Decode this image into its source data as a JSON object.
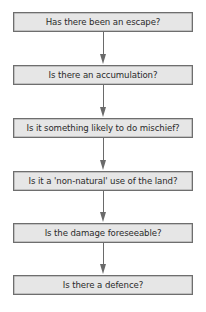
{
  "diagram": {
    "type": "flowchart",
    "direction": "top-to-bottom",
    "colors": {
      "box_fill": "#e6e6e6",
      "box_border": "#6e6e6e",
      "arrow": "#6a6a6a",
      "text": "#2a2a2a"
    },
    "steps": [
      {
        "label": "Has there been an escape?"
      },
      {
        "label": "Is there an accumulation?"
      },
      {
        "label": "Is it something likely to do mischief?"
      },
      {
        "label": "Is it a 'non-natural' use of the land?"
      },
      {
        "label": "Is the damage foreseeable?"
      },
      {
        "label": "Is there a defence?"
      }
    ]
  }
}
